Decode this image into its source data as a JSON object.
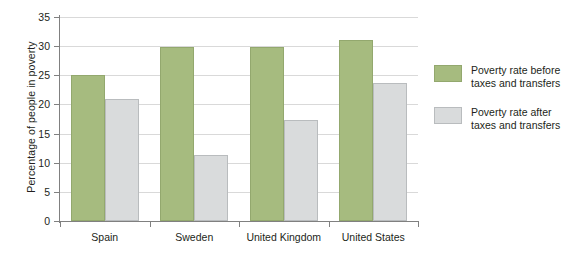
{
  "chart_data": {
    "type": "bar",
    "title": "",
    "xlabel": "",
    "ylabel": "Percentage of people in poverty",
    "ylim": [
      0,
      35
    ],
    "yticks": [
      0,
      5,
      10,
      15,
      20,
      25,
      30,
      35
    ],
    "ytick_labels": [
      "0",
      "5",
      "10",
      "15",
      "20",
      "25",
      "30",
      "35"
    ],
    "grid": true,
    "legend_position": "right",
    "categories": [
      "Spain",
      "Sweden",
      "United Kingdom",
      "United States"
    ],
    "series": [
      {
        "name": "Poverty rate before\ntaxes and transfers",
        "color": "#a6bb7f",
        "values": [
          25.0,
          29.8,
          29.8,
          31.0
        ]
      },
      {
        "name": "Poverty rate after\ntaxes and transfers",
        "color": "#d9dbdc",
        "values": [
          21.0,
          11.3,
          17.3,
          23.7
        ]
      }
    ]
  },
  "legend": {
    "items": [
      {
        "label": "Poverty rate before\ntaxes and transfers",
        "swatch": "before"
      },
      {
        "label": "Poverty rate after\ntaxes and transfers",
        "swatch": "after"
      }
    ]
  }
}
